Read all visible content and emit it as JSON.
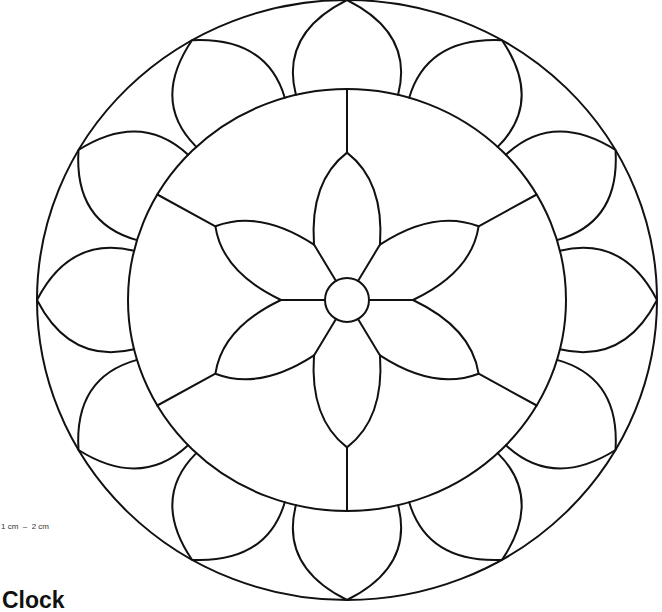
{
  "title": "Clock",
  "scale_note": "1 cm  –  2 cm",
  "pattern": {
    "description": "Stained-glass clock pattern with concentric circles, a six-petal central flower and a ring of twelve petals",
    "stroke_color": "#111111",
    "background_color": "#ffffff",
    "outer_ring_petal_count": 12,
    "inner_flower_petal_count": 6,
    "radial_divider_count": 6
  }
}
